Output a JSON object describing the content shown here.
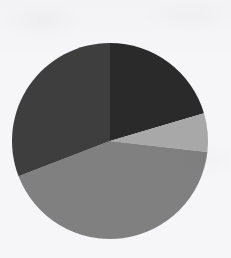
{
  "page": {
    "background_color": "#f6f5f7",
    "width": 231,
    "height": 258
  },
  "chart_data": {
    "type": "pie",
    "title": "",
    "subtitle": "",
    "xlabel": "",
    "ylabel": "",
    "legend": "none",
    "grid": false,
    "labels_shown": false,
    "start_angle_deg": 0,
    "direction": "clockwise",
    "center": {
      "x": 110,
      "y": 141
    },
    "radius": 98,
    "categories": [
      "Slice 1",
      "Slice 2",
      "Slice 3",
      "Slice 4"
    ],
    "values": [
      20.4,
      6.4,
      42.3,
      30.9
    ],
    "units": "percent",
    "total": 100,
    "colors": [
      "#2a2a2a",
      "#a8a8a8",
      "#808080",
      "#3e3e3e"
    ],
    "slices": [
      {
        "name": "Slice 1",
        "value": 20.4,
        "color": "#2a2a2a",
        "start_angle_deg": 0,
        "end_angle_deg": 73.5,
        "sweep_deg": 73.5
      },
      {
        "name": "Slice 2",
        "value": 6.4,
        "color": "#a8a8a8",
        "start_angle_deg": 73.5,
        "end_angle_deg": 96.5,
        "sweep_deg": 23.0
      },
      {
        "name": "Slice 3",
        "value": 42.3,
        "color": "#808080",
        "start_angle_deg": 96.5,
        "end_angle_deg": 248.9,
        "sweep_deg": 152.4
      },
      {
        "name": "Slice 4",
        "value": 30.9,
        "color": "#3e3e3e",
        "start_angle_deg": 248.9,
        "end_angle_deg": 360,
        "sweep_deg": 111.1
      }
    ]
  }
}
